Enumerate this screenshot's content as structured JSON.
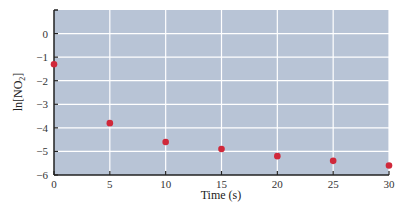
{
  "chart_data": {
    "type": "scatter",
    "title": "",
    "xlabel": "Time (s)",
    "ylabel": "ln[NO2]",
    "ylabel_main": "ln[NO",
    "ylabel_sub": "2",
    "ylabel_end": "]",
    "xlim": [
      0,
      30
    ],
    "ylim": [
      -6,
      1
    ],
    "x_ticks": [
      0,
      5,
      10,
      15,
      20,
      25,
      30
    ],
    "y_ticks": [
      0,
      -1,
      -2,
      -3,
      -4,
      -5,
      -6
    ],
    "grid": true,
    "legend": null,
    "series": [
      {
        "name": "ln[NO2]",
        "x": [
          0,
          5,
          10,
          15,
          20,
          25,
          30
        ],
        "y": [
          -1.3,
          -3.8,
          -4.6,
          -4.9,
          -5.2,
          -5.4,
          -5.6
        ]
      }
    ]
  },
  "colors": {
    "plot_bg": "#b8c4d6",
    "grid": "#ffffff",
    "point": "#d0283a",
    "axis": "#222222"
  }
}
